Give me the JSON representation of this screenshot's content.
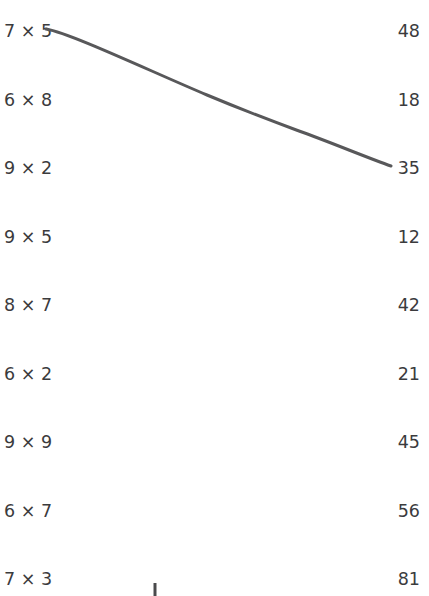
{
  "page": {
    "background_color": "#ffffff",
    "text_color": "#3b3b3d",
    "ink_color": "#58585a",
    "row_spacing_px": 68.5,
    "first_row_y_px": 20
  },
  "left_column": {
    "name": "problems",
    "items": [
      {
        "label": "7 × 5",
        "a": "7",
        "operator": "×",
        "b": "5"
      },
      {
        "label": "6 × 8",
        "a": "6",
        "operator": "×",
        "b": "8"
      },
      {
        "label": "9 × 2",
        "a": "9",
        "operator": "×",
        "b": "2"
      },
      {
        "label": "9 × 5",
        "a": "9",
        "operator": "×",
        "b": "5"
      },
      {
        "label": "8 × 7",
        "a": "8",
        "operator": "×",
        "b": "7"
      },
      {
        "label": "6 × 2",
        "a": "6",
        "operator": "×",
        "b": "2"
      },
      {
        "label": "9 × 9",
        "a": "9",
        "operator": "×",
        "b": "9"
      },
      {
        "label": "6 × 7",
        "a": "6",
        "operator": "×",
        "b": "7"
      },
      {
        "label": "7 × 3",
        "a": "7",
        "operator": "×",
        "b": "3"
      }
    ]
  },
  "right_column": {
    "name": "answers",
    "items": [
      {
        "label": "48"
      },
      {
        "label": "18"
      },
      {
        "label": "35"
      },
      {
        "label": "12"
      },
      {
        "label": "42"
      },
      {
        "label": "21"
      },
      {
        "label": "45"
      },
      {
        "label": "56"
      },
      {
        "label": "81"
      }
    ]
  },
  "drawn_marks": {
    "connection_lines": [
      {
        "name": "line-7x5-to-35",
        "from_label": "7 × 5",
        "to_label": "35",
        "color": "#58585a",
        "width_px": 3,
        "path": "M 46 29 C 70 33, 150 71, 207 95 C 250 113, 280 124, 299 131 C 330 142, 368 158, 391 166"
      }
    ],
    "stray_strokes": [
      {
        "name": "stray-vertical-tick",
        "color": "#4a4a4c",
        "width_px": 3,
        "x_px": 155,
        "y_start_px": 583,
        "y_end_px": 596
      }
    ]
  }
}
